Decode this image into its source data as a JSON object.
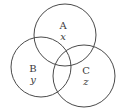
{
  "diagram": {
    "type": "venn",
    "sets": [
      {
        "id": "A",
        "label": "A",
        "variable": "x",
        "cx": 65,
        "cy": 35,
        "r": 31,
        "label_x": 63,
        "label_y": 29,
        "var_x": 63,
        "var_y": 40
      },
      {
        "id": "B",
        "label": "B",
        "variable": "y",
        "cx": 41,
        "cy": 67,
        "r": 30,
        "label_x": 33,
        "label_y": 72,
        "var_x": 33,
        "var_y": 83
      },
      {
        "id": "C",
        "label": "C",
        "variable": "z",
        "cx": 84,
        "cy": 76,
        "r": 31,
        "label_x": 86,
        "label_y": 74,
        "var_x": 86,
        "var_y": 85
      }
    ],
    "stroke_color": "#4a4a4a",
    "text_color": "#3a3a3a"
  }
}
